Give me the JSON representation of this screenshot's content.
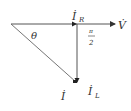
{
  "diagram": {
    "type": "phasor-diagram",
    "colors": {
      "line": "#555555",
      "text": "#333333",
      "background": "#ffffff"
    },
    "labels": {
      "current_resistive": {
        "main": "İ",
        "sub": "R"
      },
      "voltage": "V̇",
      "right_angle_num": "π",
      "right_angle_den": "2",
      "angle": "θ",
      "current_total": "İ",
      "current_inductive": {
        "main": "İ",
        "sub": "L"
      }
    }
  }
}
